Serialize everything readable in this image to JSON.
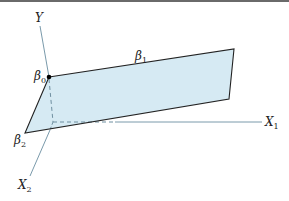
{
  "diagram": {
    "axes": {
      "y": {
        "label": "Y"
      },
      "x1": {
        "label": "X",
        "subscript": "1"
      },
      "x2": {
        "label": "X",
        "subscript": "2"
      }
    },
    "coefficients": {
      "b0": {
        "label": "β",
        "subscript": "0"
      },
      "b1": {
        "label": "β",
        "subscript": "1"
      },
      "b2": {
        "label": "β",
        "subscript": "2"
      }
    },
    "colors": {
      "plane_fill": "#d6eaf3",
      "plane_edge": "#222222",
      "axis": "#7a9aab",
      "dashed": "#6f8fa0",
      "point": "#000000",
      "frame": "#6a6a6a"
    }
  }
}
